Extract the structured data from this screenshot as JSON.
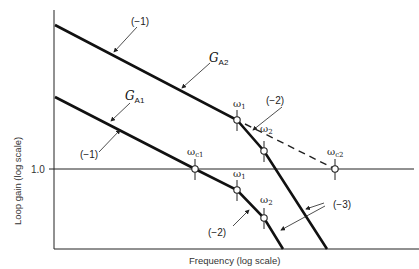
{
  "figure": {
    "x_axis_label": "Frequency (log scale)",
    "y_axis_label": "Loop gain (log scale)",
    "y_tick_label": "1.0",
    "curves": [
      {
        "name": "G_A2",
        "label_main": "G",
        "label_sub": "A2",
        "initial_slope": "(−1)",
        "breakpoints": [
          {
            "name": "ω",
            "sub": "1"
          },
          {
            "name": "ω",
            "sub": "2"
          }
        ],
        "slope_after_w1": "(−2)",
        "final_slope": "(−3)",
        "crossover": {
          "name": "ω",
          "sub": "c2"
        },
        "crossover_line_style": "dashed"
      },
      {
        "name": "G_A1",
        "label_main": "G",
        "label_sub": "A1",
        "initial_slope": "(−1)",
        "crossover": {
          "name": "ω",
          "sub": "c1"
        },
        "breakpoints": [
          {
            "name": "ω",
            "sub": "1"
          },
          {
            "name": "ω",
            "sub": "2"
          }
        ],
        "slope_after_w1": "(−2)",
        "final_slope": "(−3)"
      }
    ]
  }
}
